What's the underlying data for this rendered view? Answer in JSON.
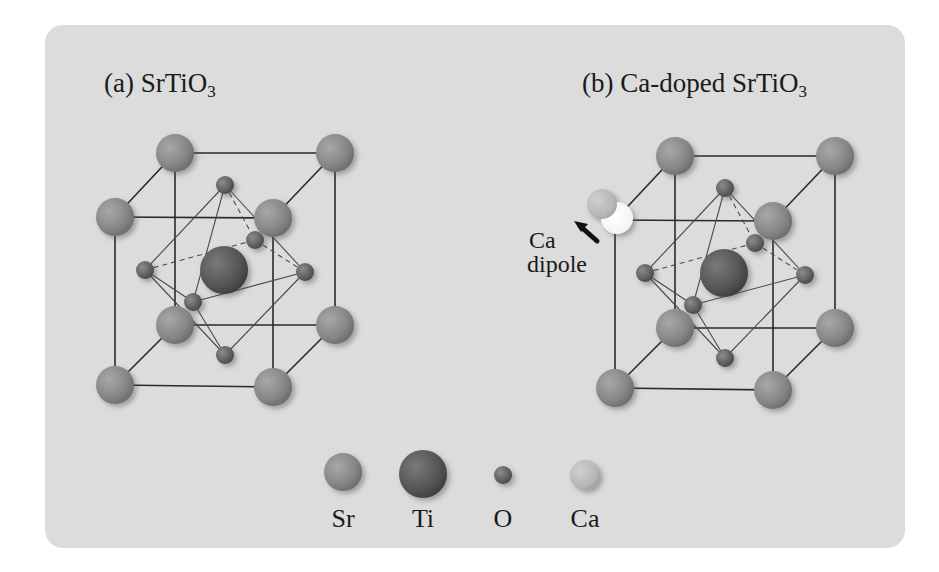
{
  "panels": [
    {
      "id": "a",
      "prefix": "(a) ",
      "formula": "SrTiO",
      "subscript": "3"
    },
    {
      "id": "b",
      "prefix": "(b) ",
      "formula": "Ca-doped SrTiO",
      "subscript": "3"
    }
  ],
  "annotation": {
    "line1": "Ca",
    "line2": "dipole"
  },
  "legend": [
    {
      "label": "Sr",
      "color": "#8a8a8a"
    },
    {
      "label": "Ti",
      "color": "#555555"
    },
    {
      "label": "O",
      "color": "#6a6a6a"
    },
    {
      "label": "Ca",
      "color": "#bdbdbd"
    }
  ],
  "colors": {
    "background": "#dcdcdc",
    "line": "#2a2a2a"
  }
}
